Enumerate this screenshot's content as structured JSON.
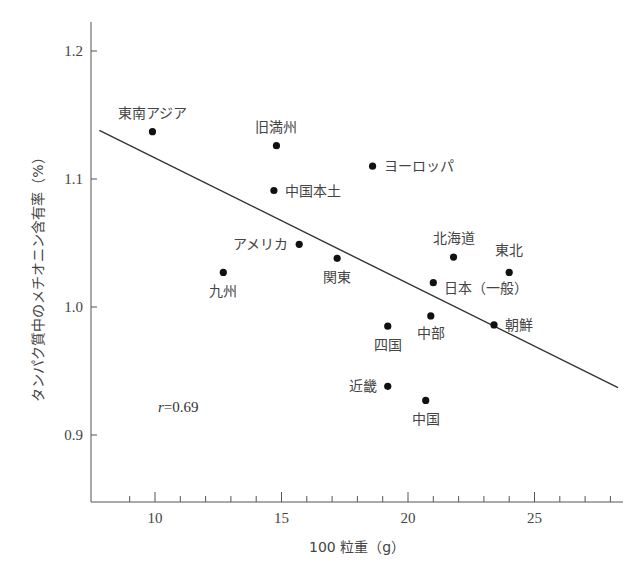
{
  "chart_data": {
    "type": "scatter",
    "title": "",
    "xlabel": "100 粒重（g）",
    "ylabel": "タンパク質中のメチオニン含有率（%）",
    "xlim": [
      7.5,
      28.5
    ],
    "ylim": [
      0.85,
      1.225
    ],
    "xticks": [
      10,
      15,
      20,
      25
    ],
    "xminor_step": 1,
    "yticks": [
      0.9,
      1.0,
      1.1,
      1.2
    ],
    "ytick_labels": [
      "0.9",
      "1.0",
      "1.1",
      "1.2"
    ],
    "grid": false,
    "annotation": {
      "text_italic": "r",
      "text": "=0.69",
      "x": 8.2,
      "y": 0.92
    },
    "regression_line": {
      "x": [
        7.8,
        28.3
      ],
      "y": [
        1.138,
        0.937
      ]
    },
    "points": [
      {
        "label": "東南アジア",
        "x": 9.9,
        "y": 1.137,
        "label_pos": "above"
      },
      {
        "label": "旧満州",
        "x": 14.8,
        "y": 1.126,
        "label_pos": "above"
      },
      {
        "label": "中国本土",
        "x": 14.7,
        "y": 1.091,
        "label_pos": "right"
      },
      {
        "label": "ヨーロッパ",
        "x": 18.6,
        "y": 1.11,
        "label_pos": "right"
      },
      {
        "label": "アメリカ",
        "x": 15.7,
        "y": 1.049,
        "label_pos": "left"
      },
      {
        "label": "関東",
        "x": 17.2,
        "y": 1.038,
        "label_pos": "below"
      },
      {
        "label": "九州",
        "x": 12.7,
        "y": 1.027,
        "label_pos": "below"
      },
      {
        "label": "北海道",
        "x": 21.8,
        "y": 1.039,
        "label_pos": "above"
      },
      {
        "label": "東北",
        "x": 24.0,
        "y": 1.027,
        "label_pos": "above"
      },
      {
        "label": "日本（一般）",
        "x": 21.0,
        "y": 1.019,
        "label_pos": "right"
      },
      {
        "label": "中部",
        "x": 20.9,
        "y": 0.993,
        "label_pos": "below"
      },
      {
        "label": "四国",
        "x": 19.2,
        "y": 0.985,
        "label_pos": "below"
      },
      {
        "label": "朝鮮",
        "x": 23.4,
        "y": 0.986,
        "label_pos": "right"
      },
      {
        "label": "近畿",
        "x": 19.2,
        "y": 0.938,
        "label_pos": "left"
      },
      {
        "label": "中国",
        "x": 20.7,
        "y": 0.927,
        "label_pos": "below"
      }
    ]
  },
  "style": {
    "axis_color": "#555555",
    "point_color": "#111111",
    "line_color": "#333333"
  }
}
